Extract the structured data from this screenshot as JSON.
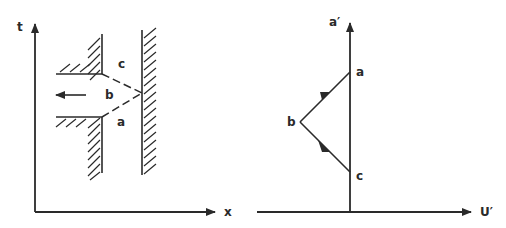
{
  "colors": {
    "ink": "#2a2a2a",
    "background": "#ffffff"
  },
  "left_panel": {
    "axis_x_label": "x",
    "axis_y_label": "t",
    "region_labels": {
      "a": "a",
      "b": "b",
      "c": "c"
    },
    "arrow_direction": "left"
  },
  "right_panel": {
    "axis_x_label": "U′",
    "axis_y_label": "a′",
    "point_labels": {
      "a": "a",
      "b": "b",
      "c": "c"
    }
  }
}
